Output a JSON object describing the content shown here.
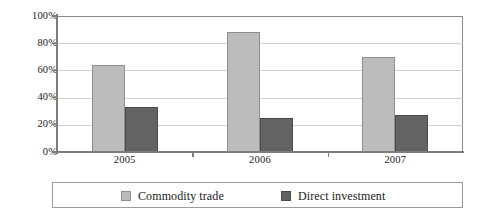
{
  "chart_data": {
    "type": "bar",
    "title": "",
    "subtitle": "",
    "xlabel": "",
    "ylabel": "",
    "categories": [
      "2005",
      "2006",
      "2007"
    ],
    "series": [
      {
        "name": "Commodity trade",
        "color": "#bcbcbc",
        "values": [
          64,
          88,
          70
        ]
      },
      {
        "name": "Direct investment",
        "color": "#636363",
        "values": [
          33,
          25,
          27
        ]
      }
    ],
    "ylim": [
      0,
      100
    ],
    "yticks": [
      0,
      20,
      40,
      60,
      80,
      100
    ],
    "ytick_labels": [
      "0%",
      "20%",
      "40%",
      "60%",
      "80%",
      "100%"
    ],
    "value_suffix": "%",
    "grid": true,
    "grid_axis": "y",
    "legend_position": "bottom",
    "frame": true
  },
  "colors": {
    "series_a": "#bcbcbc",
    "series_b": "#636363",
    "grid": "#d2d2d2",
    "axis": "#7d7d7d",
    "frame": "#8a8a8a",
    "legend_border": "#9b9b9b",
    "text": "#1a1a1a",
    "background": "#ffffff"
  }
}
